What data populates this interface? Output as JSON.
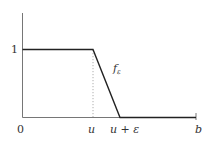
{
  "diagram": {
    "function_label": "f",
    "function_subscript": "ε",
    "y_tick_label": "1",
    "x_labels": {
      "origin": "0",
      "u": "u",
      "u_plus_eps": "u + ε",
      "b": "b"
    },
    "colors": {
      "curve": "#222222",
      "axis": "#555555",
      "dotted": "#888888",
      "text": "#333333"
    }
  }
}
